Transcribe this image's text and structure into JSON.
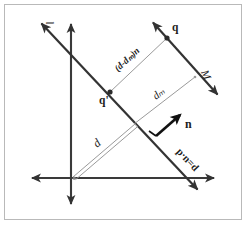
{
  "figure": {
    "background_color": "#ffffff",
    "frame_color": "#b9b9b9",
    "ink_color": "#333333",
    "thin_ink_color": "#9a9a9a",
    "bold_ink_color": "#111111",
    "width": 246,
    "height": 225
  },
  "axes": {
    "name": "cartesian-axes",
    "origin": {
      "x": 71,
      "y": 178
    },
    "vertical": {
      "x1": 71,
      "y1": 22,
      "x2": 71,
      "y2": 206,
      "arrows": "both"
    },
    "horizontal": {
      "x1": 30,
      "y1": 178,
      "x2": 216,
      "y2": 178,
      "arrows": "both"
    }
  },
  "lines": [
    {
      "name": "line-l",
      "label": "l",
      "label_x": 54,
      "label_y": 24,
      "label_rotation": -100,
      "x1": 40,
      "y1": 22,
      "x2": 199,
      "y2": 191,
      "arrows": "both"
    },
    {
      "name": "line-M",
      "label": "M",
      "label_x": 201,
      "label_y": 72,
      "label_rotation": 66,
      "x1": 152,
      "y1": 21,
      "x2": 219,
      "y2": 96,
      "arrows": "both"
    }
  ],
  "points": [
    {
      "name": "point-q",
      "label": "q",
      "x": 167,
      "y": 38,
      "label_x": 172,
      "label_y": 31
    },
    {
      "name": "point-q-prime",
      "label": "q'",
      "x": 110,
      "y": 92,
      "label_x": 100,
      "label_y": 103
    }
  ],
  "vectors": [
    {
      "name": "normal-vector-n",
      "label": "n",
      "x1": 156,
      "y1": 135,
      "x2": 181,
      "y2": 114,
      "label_x": 184,
      "label_y": 127
    }
  ],
  "measures": [
    {
      "name": "segment-d-minus-dM-n",
      "label": "(d-dₘ)n",
      "x1": 110,
      "y1": 92,
      "x2": 167,
      "y2": 38,
      "label_rotation": -43,
      "label_x": 118,
      "label_y": 72
    },
    {
      "name": "segment-dM",
      "label": "dₘ",
      "x1": 134,
      "y1": 124,
      "x2": 195,
      "y2": 77,
      "label_rotation": -38,
      "label_x": 156,
      "label_y": 100
    },
    {
      "name": "segment-d",
      "label": "d",
      "x1": 74,
      "y1": 175,
      "x2": 136,
      "y2": 122,
      "label_rotation": -40,
      "label_x": 97,
      "label_y": 148
    }
  ],
  "annotations": [
    {
      "name": "plane-equation-label",
      "label": "p·n=d",
      "x": 180,
      "y": 156,
      "rotation": 47
    }
  ]
}
